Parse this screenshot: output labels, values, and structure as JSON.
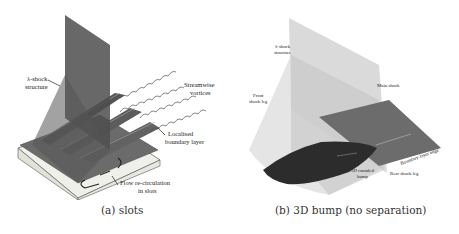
{
  "figure": {
    "subfigures": [
      {
        "id": "a",
        "caption": "(a) slots",
        "labels": {
          "lambda_shock": [
            "λ-shock",
            "structure"
          ],
          "streamwise_vortices": [
            "Streamwise",
            "vortices"
          ],
          "boundary_layer": [
            "Localised",
            "boundary layer"
          ],
          "recirculation": [
            "Flow re-circulation",
            "in slots"
          ]
        }
      },
      {
        "id": "b",
        "caption": "(b) 3D bump (no separation)",
        "labels": {
          "lambda_shock": [
            "λ-shock",
            "structure"
          ],
          "front_leg": [
            "Front",
            "shock leg"
          ],
          "main_shock": "Main shock",
          "bump": [
            "3D rounded",
            "bump"
          ],
          "rear_leg": "Rear shock leg",
          "bl_edge": "Boundary-layer edge"
        }
      }
    ]
  },
  "colors": {
    "dark_shock": "#5a5a5a",
    "light_shock": "#d8d8d8",
    "bump": "#2c2c2c",
    "plate": "#6e6e6e",
    "base": "#efefe8"
  }
}
